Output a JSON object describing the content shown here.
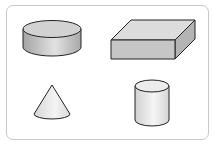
{
  "diagram": {
    "title": "",
    "shapes": [
      {
        "id": "disc-cylinder",
        "label": "",
        "type": "short cylinder"
      },
      {
        "id": "rectangular-prism",
        "label": "",
        "type": "rectangular prism"
      },
      {
        "id": "cone",
        "label": "",
        "type": "cone"
      },
      {
        "id": "tall-cylinder",
        "label": "",
        "type": "cylinder"
      }
    ],
    "colors": {
      "stroke": "#222222",
      "border": "#c8c8c8",
      "shade_dark": "#a8a8a8",
      "shade_mid": "#cfcfcf",
      "shade_light": "#eeeeee"
    }
  }
}
